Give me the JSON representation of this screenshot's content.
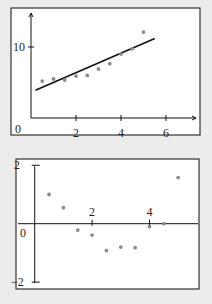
{
  "chart_data": [
    {
      "type": "scatter",
      "title": "",
      "xlabel": "",
      "ylabel": "",
      "xlim": [
        0,
        7
      ],
      "ylim": [
        0,
        15
      ],
      "x_ticks": [
        2,
        4,
        6
      ],
      "y_ticks": [
        10
      ],
      "origin_label": "0",
      "grid": false,
      "points": {
        "x": [
          0.5,
          1.0,
          1.5,
          2.0,
          2.5,
          3.0,
          3.5,
          4.0,
          4.5,
          5.0
        ],
        "y": [
          5.2,
          5.5,
          5.35,
          5.9,
          6.0,
          6.9,
          7.65,
          9.0,
          9.75,
          12.1
        ]
      },
      "fit_line": {
        "x": [
          0.2,
          5.5
        ],
        "y": [
          3.9,
          11.2
        ]
      },
      "colors": {
        "points": "#8a8a8a",
        "line": "#111111"
      }
    },
    {
      "type": "scatter",
      "title": "",
      "xlabel": "",
      "ylabel": "",
      "xlim": [
        0,
        5.7
      ],
      "ylim": [
        -2,
        2
      ],
      "x_ticks": [
        2,
        4
      ],
      "y_ticks": [
        2,
        -2
      ],
      "origin_label": "0",
      "grid": false,
      "points": {
        "x": [
          0.5,
          1.0,
          1.5,
          2.0,
          2.5,
          3.0,
          3.5,
          4.0,
          4.5,
          5.0
        ],
        "y": [
          1.0,
          0.55,
          -0.22,
          -0.39,
          -0.92,
          -0.8,
          -0.82,
          -0.1,
          0.0,
          1.58
        ]
      },
      "colors": {
        "points": "#8a8a8a",
        "line": "#111111"
      }
    }
  ]
}
